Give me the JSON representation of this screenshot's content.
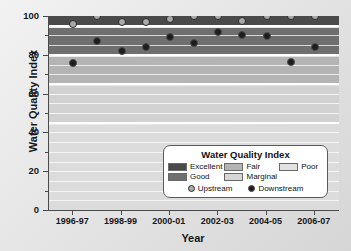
{
  "chart_data": {
    "type": "scatter",
    "title": "",
    "xlabel": "Year",
    "ylabel": "Water Quality Index",
    "ylim": [
      0,
      100
    ],
    "ytick_labels": [
      "0",
      "20",
      "40",
      "60",
      "80",
      "100"
    ],
    "ytick_values": [
      0,
      20,
      40,
      60,
      80,
      100
    ],
    "grid": true,
    "legend_position": "inside-lower-right",
    "x": [
      "1996-97",
      "1997-98",
      "1998-99",
      "1999-00",
      "2000-01",
      "2001-02",
      "2002-03",
      "2003-04",
      "2004-05",
      "2005-06",
      "2006-07"
    ],
    "xtick_labels": [
      "1996-97",
      "1998-99",
      "2000-01",
      "2002-03",
      "2004-05",
      "2006-07"
    ],
    "series": [
      {
        "name": "Upstream",
        "marker": "circle-light",
        "color": "#a9a9a9",
        "values": [
          96,
          100,
          97,
          97,
          98.5,
          100,
          100,
          97.5,
          100,
          100,
          100
        ]
      },
      {
        "name": "Downstream",
        "marker": "circle-dark",
        "color": "#1d1d1d",
        "values": [
          76,
          87,
          82,
          84,
          89,
          86,
          92,
          90,
          89.5,
          76.5,
          84
        ]
      }
    ],
    "bands": [
      {
        "label": "Excellent",
        "from": 95,
        "to": 100,
        "color": "#4a4a4a"
      },
      {
        "label": "Good",
        "from": 80,
        "to": 94,
        "color": "#6f6f6f"
      },
      {
        "label": "Fair",
        "from": 65,
        "to": 79,
        "color": "#b4b4b4"
      },
      {
        "label": "Marginal",
        "from": 45,
        "to": 64,
        "color": "#d2d2d2"
      },
      {
        "label": "Poor",
        "from": 0,
        "to": 44,
        "color": "#dcdcdc"
      }
    ]
  },
  "legend": {
    "title": "Water Quality Index",
    "categories": [
      {
        "label": "Excellent",
        "color": "#4a4a4a"
      },
      {
        "label": "Fair",
        "color": "#b4b4b4"
      },
      {
        "label": "Poor",
        "color": "#e2e2e2"
      },
      {
        "label": "Good",
        "color": "#6f6f6f"
      },
      {
        "label": "Marginal",
        "color": "#d6d6d6"
      }
    ],
    "series": [
      {
        "label": "Upstream"
      },
      {
        "label": "Downstream"
      }
    ]
  }
}
